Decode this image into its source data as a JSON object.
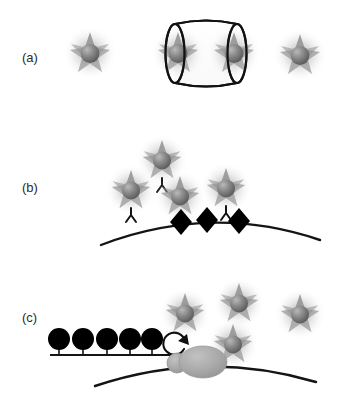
{
  "figure": {
    "background_color": "#ffffff",
    "width": 347,
    "height": 407,
    "ink_color": "#111111",
    "halo_color": "#8a8a8a",
    "core_color": "#6f6f6f",
    "star_color": "#a8a8a8",
    "membrane_color": "#141414",
    "receptor_color": "#000000",
    "protein_color": "#a8a8a8"
  },
  "panels": [
    {
      "id": "a",
      "label": "(a)",
      "label_x": 22,
      "label_y": 62,
      "description": "Free star-shaped nanoparticles and two particles enclosed in a cylindrical capsule",
      "particles": [
        {
          "name": "particle-a1",
          "cx": 90,
          "cy": 53,
          "r": 27,
          "antibody": false
        },
        {
          "name": "particle-a2",
          "cx": 178,
          "cy": 53,
          "r": 27,
          "antibody": false
        },
        {
          "name": "particle-a3",
          "cx": 234,
          "cy": 53,
          "r": 27,
          "antibody": false
        },
        {
          "name": "particle-a4",
          "cx": 300,
          "cy": 55,
          "r": 27,
          "antibody": false
        }
      ],
      "capsule": {
        "name": "cylinder-capsule",
        "x": 164,
        "y": 22,
        "width": 84,
        "height": 62,
        "cap_rx": 9
      }
    },
    {
      "id": "b",
      "label": "(b)",
      "label_x": 22,
      "label_y": 192,
      "description": "Antibody-functionalized nanoparticles binding diamond receptors on a curved membrane",
      "particles": [
        {
          "name": "particle-b1",
          "cx": 162,
          "cy": 160,
          "r": 26,
          "antibody": true
        },
        {
          "name": "particle-b2",
          "cx": 131,
          "cy": 190,
          "r": 26,
          "antibody": true
        },
        {
          "name": "particle-b3",
          "cx": 180,
          "cy": 196,
          "r": 26,
          "antibody": true
        },
        {
          "name": "particle-b4",
          "cx": 226,
          "cy": 188,
          "r": 26,
          "antibody": true
        }
      ],
      "membrane": {
        "name": "cell-membrane-curve-b",
        "start_x": 101,
        "start_y": 245,
        "ctrl_x": 211,
        "ctrl_y": 207,
        "end_x": 320,
        "end_y": 240
      },
      "receptors": [
        {
          "name": "receptor-diamond-1",
          "cx": 181,
          "cy": 222,
          "rx": 11,
          "ry": 13
        },
        {
          "name": "receptor-diamond-2",
          "cx": 207,
          "cy": 220,
          "rx": 11,
          "ry": 13
        },
        {
          "name": "receptor-diamond-3",
          "cx": 239,
          "cy": 221,
          "rx": 11,
          "ry": 13
        }
      ]
    },
    {
      "id": "c",
      "label": "(c)",
      "label_x": 22,
      "label_y": 322,
      "description": "Ligand array on a flat support with a rotating membrane protein complex and free nanoparticles",
      "particles": [
        {
          "name": "particle-c1",
          "cx": 185,
          "cy": 313,
          "r": 26,
          "antibody": false
        },
        {
          "name": "particle-c2",
          "cx": 239,
          "cy": 303,
          "r": 26,
          "antibody": false
        },
        {
          "name": "particle-c3",
          "cx": 233,
          "cy": 344,
          "r": 26,
          "antibody": false
        },
        {
          "name": "particle-c4",
          "cx": 300,
          "cy": 314,
          "r": 26,
          "antibody": false
        }
      ],
      "support_line": {
        "name": "support-baseline",
        "x1": 50,
        "y1": 355,
        "x2": 178,
        "y2": 355
      },
      "ligands": [
        {
          "name": "ligand-head-1",
          "cx": 59,
          "cy": 339,
          "r": 11
        },
        {
          "name": "ligand-head-2",
          "cx": 83,
          "cy": 339,
          "r": 11
        },
        {
          "name": "ligand-head-3",
          "cx": 107,
          "cy": 339,
          "r": 11
        },
        {
          "name": "ligand-head-4",
          "cx": 130,
          "cy": 339,
          "r": 11
        },
        {
          "name": "ligand-head-5",
          "cx": 152,
          "cy": 339,
          "r": 11
        }
      ],
      "rotation_arrow": {
        "name": "rotation-arrow-icon",
        "cx": 176,
        "cy": 345,
        "r": 11,
        "direction": "counterclockwise"
      },
      "protein": {
        "name": "membrane-protein-body",
        "cx": 203,
        "cy": 362,
        "rx": 24,
        "ry": 16,
        "stalk_cx": 177,
        "stalk_cy": 363,
        "stalk_r": 10
      },
      "membrane": {
        "name": "cell-membrane-curve-c",
        "start_x": 95,
        "start_y": 386,
        "ctrl_x": 205,
        "ctrl_y": 349,
        "end_x": 316,
        "end_y": 382
      }
    }
  ]
}
